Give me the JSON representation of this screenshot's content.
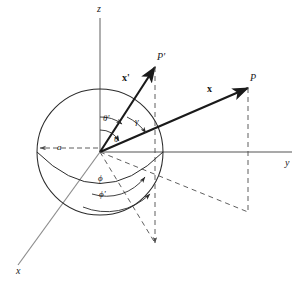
{
  "figure": {
    "background_color": "#ffffff",
    "axis_color": "#808080",
    "line_color": "#1a1a1a",
    "dash_color": "#4d4d4d",
    "width": 300,
    "height": 288
  },
  "axes": [
    {
      "key": "z",
      "label": "z",
      "label_x": 97,
      "label_y": 4
    },
    {
      "key": "y",
      "label": "y",
      "label_x": 285,
      "label_y": 158
    },
    {
      "key": "x",
      "label": "x",
      "label_x": 16,
      "label_y": 266
    }
  ],
  "points": [
    {
      "key": "P_prime",
      "label": "P'",
      "label_x": 157,
      "label_y": 52
    },
    {
      "key": "P",
      "label": "P",
      "label_x": 250,
      "label_y": 73
    }
  ],
  "vectors": [
    {
      "key": "x_prime",
      "label": "x'",
      "label_x": 122,
      "label_y": 73
    },
    {
      "key": "x",
      "label": "x",
      "label_x": 207,
      "label_y": 84
    }
  ],
  "angles": [
    {
      "key": "theta_prime",
      "label": "θ'",
      "label_x": 103,
      "label_y": 114
    },
    {
      "key": "gamma",
      "label": "γ",
      "label_x": 135,
      "label_y": 117
    },
    {
      "key": "theta",
      "label": "θ",
      "label_x": 114,
      "label_y": 135
    },
    {
      "key": "phi",
      "label": "ϕ",
      "label_x": 98,
      "label_y": 174
    },
    {
      "key": "phi_prime",
      "label": "ϕ'",
      "label_x": 99,
      "label_y": 190
    }
  ],
  "dimensions": [
    {
      "key": "radius",
      "label": "a",
      "label_x": 57,
      "label_y": 143
    }
  ],
  "chart_data": {
    "type": "diagram",
    "origin": {
      "x": 100,
      "y": 152
    },
    "sphere": {
      "center_x": 100,
      "center_y": 152,
      "radius": 63
    },
    "axis_endpoints": {
      "z": {
        "x": 100,
        "y": 18
      },
      "y": {
        "x": 292,
        "y": 152
      },
      "x": {
        "x": 18,
        "y": 265
      }
    },
    "point_positions": {
      "P_prime": {
        "x": 155,
        "y": 67
      },
      "P": {
        "x": 248,
        "y": 88
      }
    },
    "projections": {
      "P_prime_foot": {
        "x": 155,
        "y": 245
      },
      "P_foot": {
        "x": 248,
        "y": 212
      }
    }
  }
}
